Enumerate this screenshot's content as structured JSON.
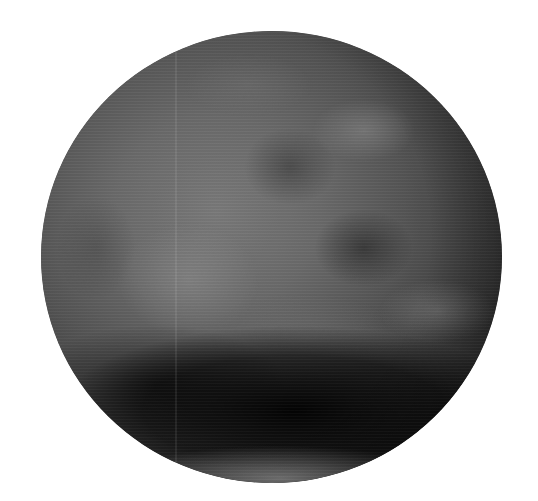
{
  "image": {
    "subject": "grayscale planetary sphere",
    "description": "A blurry grayscale spherical body with mottled light and dark albedo patches, darker toward the bottom, on a white background",
    "colors": {
      "background": "#ffffff",
      "sphere_mid": "#555555",
      "sphere_light": "#7a7a7a",
      "sphere_dark": "#0a0a0a"
    },
    "sphere_geometry": {
      "center_x": 271,
      "center_y": 257,
      "radius_x": 230,
      "radius_y": 226
    }
  }
}
